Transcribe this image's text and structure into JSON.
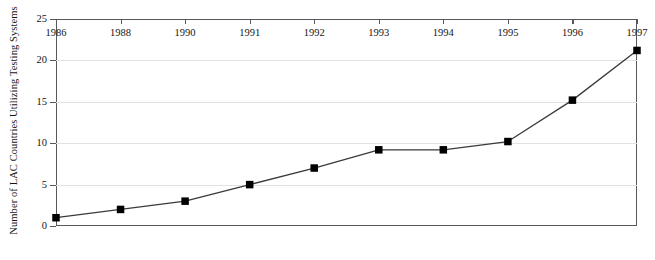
{
  "chart_data": {
    "type": "line",
    "title": "",
    "subtitle": "",
    "xlabel": "",
    "ylabel": "Number of LAC Countries Utilizing Testing Systems",
    "categories": [
      "1986",
      "1988",
      "1990",
      "1991",
      "1992",
      "1993",
      "1994",
      "1995",
      "1996",
      "1997"
    ],
    "values": [
      1,
      2,
      3,
      5,
      7,
      9.2,
      9.2,
      10.2,
      15.2,
      21.2
    ],
    "series": [
      {
        "name": "LAC countries utilizing testing systems",
        "values": [
          1,
          2,
          3,
          5,
          7,
          9.2,
          9.2,
          10.2,
          15.2,
          21.2
        ]
      }
    ],
    "ylim": [
      0,
      25
    ],
    "y_ticks": [
      0,
      5,
      10,
      15,
      20,
      25
    ],
    "y_tick_labels": [
      "0",
      "5",
      "10",
      "15",
      "20",
      "25"
    ],
    "grid": true,
    "grid_axis": "y",
    "legend": false,
    "legend_position": "none",
    "marker": "square",
    "marker_color": "#000000",
    "line_color": "#3a3a3a",
    "axis_color": "#55585c",
    "grid_color": "#e2e2e4",
    "background_color": "#ffffff"
  },
  "axes": {
    "y_title": "Number of LAC Countries Utilizing Testing Systems"
  }
}
